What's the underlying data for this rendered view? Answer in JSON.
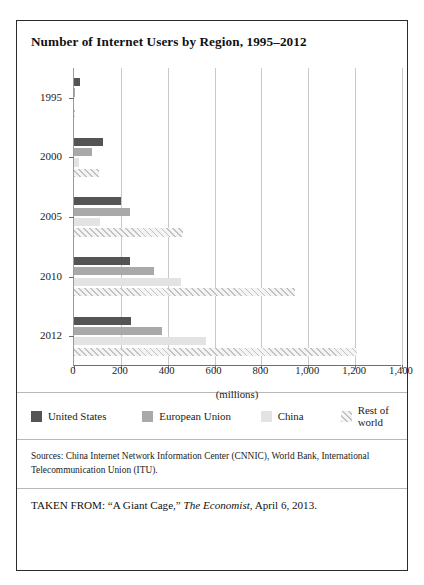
{
  "figure": {
    "title": "Number of Internet Users by Region, 1995–2012",
    "sources": "Sources: China Internet Network Information Center (CNNIC), World Bank, International Telecommunication Union (ITU).",
    "taken_from_prefix": "TAKEN FROM: “A Giant Cage,” ",
    "taken_from_italic": "The Economist",
    "taken_from_suffix": ", April 6, 2013."
  },
  "colors": {
    "united_states": "#545454",
    "european_union": "#a9a9a9",
    "china": "#e3e3e3",
    "rest_of_world": "#f4f4f4",
    "hatch": "#c2c2c2",
    "gridline": "#c9c9c9",
    "axis": "#6e6e6e",
    "border": "#2b2b2b"
  },
  "legend": {
    "position": "bottom",
    "items": [
      {
        "label": "United States",
        "key": "us"
      },
      {
        "label": "European Union",
        "key": "eu"
      },
      {
        "label": "China",
        "key": "cn"
      },
      {
        "label": "Rest of world",
        "key": "row"
      }
    ]
  },
  "chart_data": {
    "type": "bar",
    "orientation": "horizontal",
    "title": "Number of Internet Users by Region, 1995–2012",
    "xlabel": "(millions)",
    "ylabel": "",
    "categories": [
      "1995",
      "2000",
      "2005",
      "2010",
      "2012"
    ],
    "xlim": [
      0,
      1400
    ],
    "xticks": [
      0,
      200,
      400,
      600,
      800,
      1000,
      1200,
      1400
    ],
    "xticklabels": [
      "0",
      "200",
      "400",
      "600",
      "800",
      "1,000",
      "1,200",
      "1,400"
    ],
    "grid": "vertical",
    "series": [
      {
        "name": "United States",
        "key": "us",
        "values": [
          25,
          124,
          200,
          240,
          245
        ]
      },
      {
        "name": "European Union",
        "key": "eu",
        "values": [
          5,
          75,
          240,
          340,
          375
        ]
      },
      {
        "name": "China",
        "key": "cn",
        "values": [
          0,
          22,
          111,
          457,
          564
        ]
      },
      {
        "name": "Rest of world",
        "key": "row",
        "values": [
          3,
          105,
          465,
          945,
          1210
        ]
      }
    ]
  }
}
